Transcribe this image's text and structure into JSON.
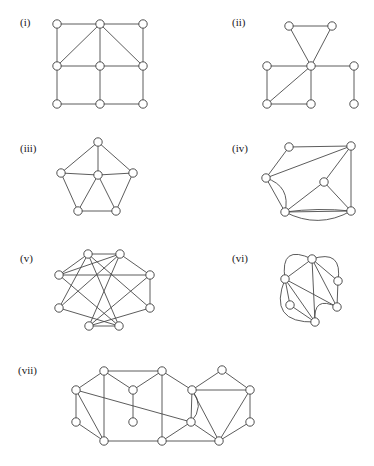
{
  "figure": {
    "background_color": "#ffffff",
    "edge_color": "#4a4a4a",
    "vertex_fill_color": "#ffffff",
    "vertex_stroke_color": "#3c3c3c",
    "label_color": "#1a1a1a",
    "vertex_radius": 4.2,
    "panel_count": 7
  },
  "panels": [
    {
      "id": "i",
      "label": "(i)",
      "label_x": 20,
      "label_y": 26,
      "description": "3 by 3 grid graph with two diagonals from the top middle vertex",
      "vertex_count": 9,
      "edge_count": 14,
      "vertices": [
        {
          "name": "v1",
          "x": 57,
          "y": 24
        },
        {
          "name": "v2",
          "x": 100,
          "y": 24
        },
        {
          "name": "v3",
          "x": 143,
          "y": 24
        },
        {
          "name": "v4",
          "x": 57,
          "y": 66
        },
        {
          "name": "v5",
          "x": 100,
          "y": 66
        },
        {
          "name": "v6",
          "x": 143,
          "y": 66
        },
        {
          "name": "v7",
          "x": 57,
          "y": 104
        },
        {
          "name": "v8",
          "x": 100,
          "y": 104
        },
        {
          "name": "v9",
          "x": 143,
          "y": 104
        }
      ],
      "edges": [
        [
          0,
          1
        ],
        [
          1,
          2
        ],
        [
          3,
          4
        ],
        [
          4,
          5
        ],
        [
          6,
          7
        ],
        [
          7,
          8
        ],
        [
          0,
          3
        ],
        [
          3,
          6
        ],
        [
          1,
          4
        ],
        [
          4,
          7
        ],
        [
          2,
          5
        ],
        [
          5,
          8
        ],
        [
          1,
          3
        ],
        [
          1,
          5
        ]
      ],
      "curved_edges": []
    },
    {
      "id": "ii",
      "label": "(ii)",
      "label_x": 232,
      "label_y": 26,
      "description": "Triangle over a central hub with attached rectangle, a diagonal and a pendant right branch",
      "vertex_count": 8,
      "edge_count": 10,
      "vertices": [
        {
          "name": "v1",
          "x": 289,
          "y": 26
        },
        {
          "name": "v2",
          "x": 332,
          "y": 26
        },
        {
          "name": "v3",
          "x": 311,
          "y": 66
        },
        {
          "name": "v4",
          "x": 267,
          "y": 66
        },
        {
          "name": "v5",
          "x": 354,
          "y": 66
        },
        {
          "name": "v6",
          "x": 267,
          "y": 104
        },
        {
          "name": "v7",
          "x": 311,
          "y": 104
        },
        {
          "name": "v8",
          "x": 354,
          "y": 104
        }
      ],
      "edges": [
        [
          0,
          1
        ],
        [
          0,
          2
        ],
        [
          1,
          2
        ],
        [
          2,
          3
        ],
        [
          2,
          4
        ],
        [
          3,
          5
        ],
        [
          5,
          6
        ],
        [
          6,
          2
        ],
        [
          2,
          5
        ],
        [
          4,
          7
        ]
      ],
      "curved_edges": []
    },
    {
      "id": "iii",
      "label": "(iii)",
      "label_x": 20,
      "label_y": 152,
      "description": "Wheel graph W5: outer pentagon with a hub joined to all five rim vertices",
      "vertex_count": 6,
      "edge_count": 10,
      "vertices": [
        {
          "name": "hub",
          "x": 98,
          "y": 175
        },
        {
          "name": "r1",
          "x": 98,
          "y": 142
        },
        {
          "name": "r2",
          "x": 61,
          "y": 173
        },
        {
          "name": "r3",
          "x": 133,
          "y": 173
        },
        {
          "name": "r4",
          "x": 78,
          "y": 211
        },
        {
          "name": "r5",
          "x": 116,
          "y": 211
        }
      ],
      "edges": [
        [
          0,
          1
        ],
        [
          0,
          2
        ],
        [
          0,
          3
        ],
        [
          0,
          4
        ],
        [
          0,
          5
        ],
        [
          1,
          2
        ],
        [
          1,
          3
        ],
        [
          2,
          4
        ],
        [
          3,
          5
        ],
        [
          4,
          5
        ]
      ],
      "curved_edges": []
    },
    {
      "id": "iv",
      "label": "(iv)",
      "label_x": 232,
      "label_y": 152,
      "description": "Six vertex multigraph with a doubled left edge and a doubled bottom edge drawn as arcs",
      "vertex_count": 6,
      "edge_count": 12,
      "vertices": [
        {
          "name": "a",
          "x": 289,
          "y": 147
        },
        {
          "name": "b",
          "x": 351,
          "y": 146
        },
        {
          "name": "c",
          "x": 266,
          "y": 178
        },
        {
          "name": "d",
          "x": 324,
          "y": 182
        },
        {
          "name": "e",
          "x": 285,
          "y": 212
        },
        {
          "name": "f",
          "x": 351,
          "y": 211
        }
      ],
      "edges": [
        [
          0,
          1
        ],
        [
          0,
          2
        ],
        [
          1,
          2
        ],
        [
          1,
          3
        ],
        [
          1,
          5
        ],
        [
          2,
          4
        ],
        [
          3,
          4
        ],
        [
          3,
          5
        ],
        [
          4,
          5
        ]
      ],
      "curved_edges": [
        {
          "from": 2,
          "to": 4,
          "bulge": -9
        },
        {
          "from": 4,
          "to": 5,
          "bulge": 9
        },
        {
          "from": 4,
          "to": 5,
          "bulge": -2
        }
      ]
    },
    {
      "id": "v",
      "label": "(v)",
      "label_x": 20,
      "label_y": 262,
      "description": "Eight vertex graph with many crossing chords, Petersen-like drawing",
      "vertex_count": 8,
      "edge_count": 16,
      "vertices": [
        {
          "name": "t1",
          "x": 88,
          "y": 254
        },
        {
          "name": "t2",
          "x": 120,
          "y": 254
        },
        {
          "name": "l1",
          "x": 59,
          "y": 275
        },
        {
          "name": "r1",
          "x": 150,
          "y": 275
        },
        {
          "name": "l2",
          "x": 59,
          "y": 308
        },
        {
          "name": "r2",
          "x": 150,
          "y": 308
        },
        {
          "name": "b1",
          "x": 89,
          "y": 326
        },
        {
          "name": "b2",
          "x": 119,
          "y": 326
        }
      ],
      "edges": [
        [
          0,
          1
        ],
        [
          0,
          2
        ],
        [
          0,
          4
        ],
        [
          0,
          5
        ],
        [
          0,
          7
        ],
        [
          1,
          2
        ],
        [
          1,
          3
        ],
        [
          1,
          4
        ],
        [
          1,
          6
        ],
        [
          2,
          3
        ],
        [
          2,
          7
        ],
        [
          3,
          5
        ],
        [
          3,
          6
        ],
        [
          4,
          7
        ],
        [
          5,
          6
        ],
        [
          6,
          7
        ]
      ],
      "curved_edges": []
    },
    {
      "id": "vi",
      "label": "(vi)",
      "label_x": 232,
      "label_y": 262,
      "description": "Five vertex multigraph with large outer arcs creating parallel edges",
      "vertex_count": 5,
      "edge_count": 11,
      "vertices": [
        {
          "name": "top",
          "x": 312,
          "y": 259
        },
        {
          "name": "left",
          "x": 285,
          "y": 279
        },
        {
          "name": "right",
          "x": 338,
          "y": 281
        },
        {
          "name": "lower",
          "x": 290,
          "y": 305
        },
        {
          "name": "bottom",
          "x": 315,
          "y": 322
        },
        {
          "name": "rlow",
          "x": 337,
          "y": 307
        }
      ],
      "edges": [
        [
          0,
          1
        ],
        [
          0,
          2
        ],
        [
          0,
          4
        ],
        [
          0,
          5
        ],
        [
          1,
          3
        ],
        [
          1,
          4
        ],
        [
          1,
          5
        ],
        [
          2,
          5
        ],
        [
          3,
          4
        ]
      ],
      "curved_edges": [
        {
          "from": 0,
          "to": 1,
          "bulge": 16
        },
        {
          "from": 0,
          "to": 2,
          "bulge": -14
        },
        {
          "from": 1,
          "to": 4,
          "bulge": 20
        },
        {
          "from": 4,
          "to": 5,
          "bulge": -12
        }
      ]
    },
    {
      "id": "vii",
      "label": "(vii)",
      "label_x": 18,
      "label_y": 374,
      "description": "Wide fifteen vertex graph made of three joined blocks with one doubled curved edge",
      "vertex_count": 14,
      "edge_count": 25,
      "vertices": [
        {
          "name": "a",
          "x": 104,
          "y": 371
        },
        {
          "name": "b",
          "x": 162,
          "y": 371
        },
        {
          "name": "c",
          "x": 222,
          "y": 370
        },
        {
          "name": "d",
          "x": 76,
          "y": 390
        },
        {
          "name": "e",
          "x": 133,
          "y": 390
        },
        {
          "name": "f",
          "x": 192,
          "y": 390
        },
        {
          "name": "g",
          "x": 250,
          "y": 390
        },
        {
          "name": "h",
          "x": 76,
          "y": 422
        },
        {
          "name": "i",
          "x": 133,
          "y": 422
        },
        {
          "name": "j",
          "x": 191,
          "y": 422
        },
        {
          "name": "k",
          "x": 250,
          "y": 422
        },
        {
          "name": "l",
          "x": 104,
          "y": 441
        },
        {
          "name": "m",
          "x": 162,
          "y": 441
        },
        {
          "name": "n",
          "x": 219,
          "y": 441
        }
      ],
      "edges": [
        [
          0,
          1
        ],
        [
          0,
          3
        ],
        [
          0,
          11
        ],
        [
          0,
          4
        ],
        [
          1,
          4
        ],
        [
          1,
          12
        ],
        [
          1,
          5
        ],
        [
          2,
          5
        ],
        [
          2,
          6
        ],
        [
          3,
          7
        ],
        [
          3,
          11
        ],
        [
          3,
          9
        ],
        [
          4,
          8
        ],
        [
          5,
          9
        ],
        [
          5,
          13
        ],
        [
          6,
          10
        ],
        [
          6,
          13
        ],
        [
          6,
          5
        ],
        [
          7,
          11
        ],
        [
          9,
          13
        ],
        [
          9,
          12
        ],
        [
          10,
          13
        ],
        [
          11,
          12
        ],
        [
          12,
          13
        ]
      ],
      "curved_edges": [
        {
          "from": 5,
          "to": 9,
          "bulge": -7
        }
      ]
    }
  ]
}
